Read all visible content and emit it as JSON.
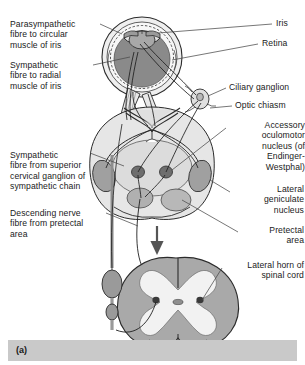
{
  "figure": {
    "caption": "(a)"
  },
  "labels_left": [
    {
      "id": "parasympathetic-fibre-circular",
      "text": "Parasympathetic\nfibre to circular\nmuscle of iris",
      "x": 10,
      "y": 19
    },
    {
      "id": "sympathetic-fibre-radial",
      "text": "Sympathetic\nfibre to radial\nmuscle of iris",
      "x": 10,
      "y": 60
    },
    {
      "id": "sympathetic-fibre-superior-cervical",
      "text": "Sympathetic\nfibre from superior\ncervical ganglion of\nsympathetic chain",
      "x": 10,
      "y": 150
    },
    {
      "id": "descending-nerve-fibre-pretectal",
      "text": "Descending nerve\nfibre from pretectal\narea",
      "x": 10,
      "y": 208
    }
  ],
  "labels_right": [
    {
      "id": "iris",
      "text": "Iris",
      "x": 275,
      "y": 22
    },
    {
      "id": "retina",
      "text": "Retina",
      "x": 262,
      "y": 41
    },
    {
      "id": "ciliary-ganglion",
      "text": "Ciliary ganglion",
      "x": 228,
      "y": 86
    },
    {
      "id": "optic-chiasm",
      "text": "Optic chiasm",
      "x": 234,
      "y": 104
    },
    {
      "id": "accessory-oculomotor-nucleus",
      "text": "Accessory\noculomotor\nnucleus (of\nEndinger-\nWestphal)",
      "x": 228,
      "y": 124
    },
    {
      "id": "lateral-geniculate-nucleus",
      "text": "Lateral\ngeniculate\nnucleus",
      "x": 233,
      "y": 188
    },
    {
      "id": "pretectal-area",
      "text": "Pretectal\narea",
      "x": 240,
      "y": 229
    },
    {
      "id": "lateral-horn-spinal-cord",
      "text": "Lateral horn of\nspinal cord",
      "x": 224,
      "y": 264
    }
  ],
  "anatomy": {
    "eye": {
      "name": "eye-globe",
      "sclera_color": "#efefef",
      "vitreous_color": "#8a8a8a",
      "iris_color": "#a8a8a8",
      "outline_color": "#2b2b2b"
    },
    "brainstem": {
      "name": "brainstem-cross-section",
      "fill_color": "#dcdcdc",
      "lgn_color": "#a0a0a0",
      "pretectal_color": "#b4b4b4",
      "nucleus_color": "#6e6e6e"
    },
    "spinal_cord": {
      "name": "spinal-cord-cross-section",
      "white_matter_color": "#a9a9a9",
      "grey_matter_color": "#f2f2f2",
      "lateral_horn_color": "#3a3a3a"
    },
    "sympathetic_chain": {
      "name": "sympathetic-chain",
      "ganglion_color": "#9a9a9a"
    },
    "arrow": {
      "name": "descending-direction-arrow",
      "color": "#555555"
    }
  },
  "colors": {
    "background": "#ffffff",
    "text": "#1a1a1a",
    "leader_line": "#4a4a4a",
    "caption_bar": "#c9c9c9"
  }
}
